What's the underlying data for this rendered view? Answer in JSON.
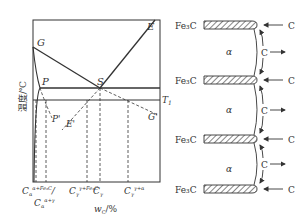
{
  "phase_diagram": {
    "y_axis_label": "温度/℃",
    "x_axis_label": "w_C/%",
    "x_axis_label_main": "w",
    "x_axis_label_sub": "C",
    "x_axis_label_unit": "/%",
    "points": {
      "G": "G",
      "E": "E",
      "P": "P",
      "S": "S",
      "P_prime": "P'",
      "E_prime": "E'",
      "G_prime": "G'",
      "T1": "T",
      "T1_sub": "1"
    },
    "x_ticks": [
      {
        "main": "C",
        "sub": "α",
        "sup": "α+Fe₃C",
        "suffix": "/"
      },
      {
        "main": "C",
        "sub": "α",
        "sup": "α+γ"
      },
      {
        "main": "C",
        "sub": "γ",
        "sup": "γ+Fe₃C"
      },
      {
        "main": "C",
        "sub": "γ",
        "sup": ""
      },
      {
        "main": "C",
        "sub": "γ",
        "sup": "γ+α"
      }
    ]
  },
  "growth_schematic": {
    "plates": [
      {
        "label": "Fe₃C"
      },
      {
        "label": "Fe₃C"
      },
      {
        "label": "Fe₃C"
      },
      {
        "label": "Fe₃C"
      }
    ],
    "phase_labels": [
      "α",
      "α",
      "α"
    ],
    "carbon_label": "C"
  }
}
